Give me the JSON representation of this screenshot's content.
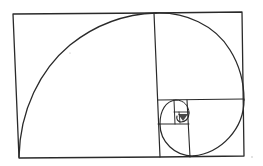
{
  "diagram": {
    "title": "",
    "colors": {
      "background": "#ffffff",
      "ink": "#2a2a2a",
      "speck": "#b0b0b0"
    },
    "outer_rectangle": {
      "top_left": [
        13,
        14
      ],
      "top_right": [
        242,
        12
      ],
      "bottom_right": [
        244,
        156
      ],
      "bottom_left": [
        19,
        158
      ]
    },
    "squares": [
      {
        "id": "square-1",
        "bounds": [
          13,
          13,
          156,
          158
        ]
      },
      {
        "id": "square-2",
        "bounds": [
          154,
          12,
          244,
          100
        ]
      },
      {
        "id": "square-3",
        "bounds": [
          187,
          100,
          244,
          157
        ]
      },
      {
        "id": "square-4",
        "bounds": [
          158,
          124,
          190,
          157
        ]
      },
      {
        "id": "square-5",
        "bounds": [
          158,
          100,
          174,
          124
        ]
      },
      {
        "id": "square-6",
        "bounds": [
          174,
          100,
          189,
          116
        ]
      },
      {
        "id": "square-7",
        "bounds": [
          179,
          110,
          189,
          122
        ]
      }
    ],
    "labels": []
  }
}
